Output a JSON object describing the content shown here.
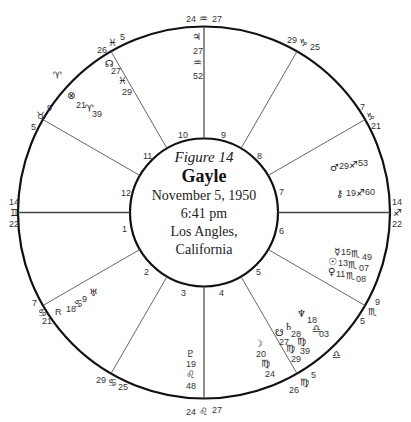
{
  "center": {
    "figure_label": "Figure 14",
    "name": "Gayle",
    "date": "November 5, 1950",
    "time": "6:41 pm",
    "place_line1": "Los Angles,",
    "place_line2": "California"
  },
  "house_numbers": [
    "1",
    "2",
    "3",
    "4",
    "5",
    "6",
    "7",
    "8",
    "9",
    "10",
    "11",
    "12"
  ],
  "cusps": {
    "mc": {
      "deg": "24",
      "sign": "♒",
      "min": "27"
    },
    "c11": {
      "deg": "26",
      "sign": "♓",
      "min": "5"
    },
    "c12": {
      "deg": "9",
      "sign": "♉",
      "min": "5"
    },
    "asc": {
      "deg": "14",
      "sign": "♊",
      "min": "22"
    },
    "c2": {
      "deg": "7",
      "sign": "♋",
      "min": "21"
    },
    "c3": {
      "deg": "29",
      "sign": "♋",
      "min": "25"
    },
    "ic": {
      "deg": "24",
      "sign": "♌",
      "min": "27"
    },
    "c5": {
      "deg": "26",
      "sign": "♍",
      "min": "5"
    },
    "c6": {
      "deg": "9",
      "sign": "♏",
      "min": "5"
    },
    "dsc": {
      "deg": "14",
      "sign": "♐",
      "min": "22"
    },
    "c8": {
      "deg": "7",
      "sign": "♑",
      "min": "21"
    },
    "c9": {
      "deg": "29",
      "sign": "♑",
      "min": "25"
    }
  },
  "intercepted_signs": {
    "aries": "♈",
    "libra": "♎"
  },
  "planets": {
    "jupiter": {
      "glyph": "♃",
      "deg": "27",
      "sign": "♒",
      "min": "52"
    },
    "north_node": {
      "glyph": "☊",
      "deg": "27",
      "sign": "♓",
      "min": "29"
    },
    "part_of_fortune": {
      "glyph": "⊗",
      "deg": "21",
      "sign": "♈",
      "min": "39"
    },
    "uranus": {
      "glyph": "♅",
      "deg": "9",
      "sign": "♋",
      "min": "18",
      "retro": "R"
    },
    "pluto": {
      "glyph": "♇",
      "deg": "19",
      "sign": "♌",
      "min": "48"
    },
    "moon": {
      "glyph": "☽",
      "deg": "20",
      "sign": "♍",
      "min": "24"
    },
    "south_node": {
      "glyph": "☋",
      "deg": "27",
      "sign": "♍",
      "min": "29"
    },
    "saturn": {
      "glyph": "♄",
      "deg": "28",
      "sign": "♍",
      "min": "39"
    },
    "neptune": {
      "glyph": "♆",
      "deg": "18",
      "sign": "♎",
      "min": "03"
    },
    "venus": {
      "glyph": "♀",
      "deg": "11",
      "sign": "♏",
      "min": "08"
    },
    "sun": {
      "glyph": "☉",
      "deg": "13",
      "sign": "♏",
      "min": "07"
    },
    "mercury": {
      "glyph": "☿",
      "deg": "15",
      "sign": "♏",
      "min": "49"
    },
    "chiron": {
      "glyph": "⚷",
      "deg": "19",
      "sign": "♐",
      "min": "60"
    },
    "mars": {
      "glyph": "♂",
      "deg": "29",
      "sign": "♐",
      "min": "53"
    }
  }
}
